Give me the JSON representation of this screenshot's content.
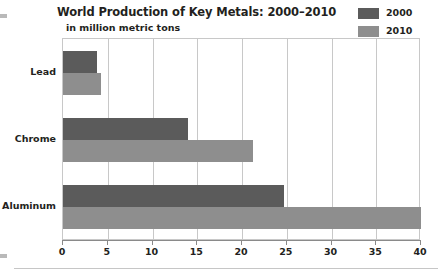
{
  "chart_data": {
    "type": "bar",
    "orientation": "horizontal",
    "title": "World Production of Key Metals: 2000–2010",
    "subtitle": "in million metric tons",
    "xlabel": "",
    "ylabel": "",
    "categories": [
      "Lead",
      "Chrome",
      "Aluminum"
    ],
    "series": [
      {
        "name": "2000",
        "color": "#5b5b5b",
        "values": [
          3.8,
          14.0,
          24.7
        ]
      },
      {
        "name": "2010",
        "color": "#8e8e8e",
        "values": [
          4.3,
          21.2,
          40.0
        ]
      }
    ],
    "xlim": [
      0,
      40
    ],
    "xticks": [
      0,
      5,
      10,
      15,
      20,
      25,
      30,
      35,
      40
    ],
    "xtick_labels": [
      "0",
      "5",
      "10",
      "15",
      "20",
      "25",
      "30",
      "35",
      "40"
    ],
    "grid": "vertical",
    "legend_position": "top-right"
  },
  "legend": {
    "items": [
      {
        "label": "2000",
        "color": "#5b5b5b"
      },
      {
        "label": "2010",
        "color": "#8e8e8e"
      }
    ]
  },
  "colors": {
    "series_2000": "#5b5b5b",
    "series_2010": "#8e8e8e",
    "grid": "#c8c8c8",
    "axis": "#8a8a8a",
    "text": "#231f20",
    "background": "#ffffff"
  }
}
